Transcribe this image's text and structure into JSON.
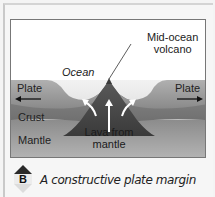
{
  "figure": {
    "labels": {
      "volcano": [
        "Mid-ocean",
        "volcano"
      ],
      "ocean": "Ocean",
      "plate_left": "Plate",
      "plate_right": "Plate",
      "crust": "Crust",
      "mantle": "Mantle",
      "lava": [
        "Lava from",
        "mantle"
      ]
    },
    "colors": {
      "ocean": "#e9e9e9",
      "plate": "#8e8e8e",
      "crust": "#7a7a7a",
      "mantle": "#9a9a9a",
      "volcano": "#4a4a4a",
      "arrow": "#ffffff"
    }
  },
  "caption": {
    "badge_letter": "B",
    "text": "A constructive plate margin"
  }
}
